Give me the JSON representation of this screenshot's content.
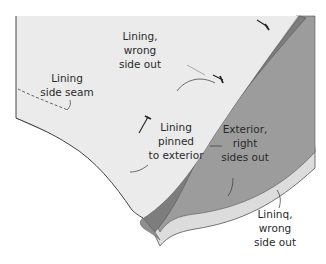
{
  "figure": {
    "type": "sewing-illustration",
    "colors": {
      "background": "#ffffff",
      "lining_panel": "#ebebeb",
      "lining_strip": "#dcdcdc",
      "exterior_panel": "#9c9c9c",
      "exterior_band": "#7d7d7d",
      "outline": "#555555",
      "pin": "#222222",
      "text": "#2a2a2a"
    },
    "labels": {
      "lining_wrong_top": [
        "Lining,",
        "wrong",
        "side out"
      ],
      "lining_side_seam": [
        "Lining",
        "side seam"
      ],
      "lining_pinned": [
        "Lining",
        "pinned",
        "to exterior"
      ],
      "exterior_right": [
        "Exterior,",
        "right",
        "sides out"
      ],
      "lining_wrong_bottom": [
        "Lininq,",
        "wrong",
        "side out"
      ]
    }
  }
}
